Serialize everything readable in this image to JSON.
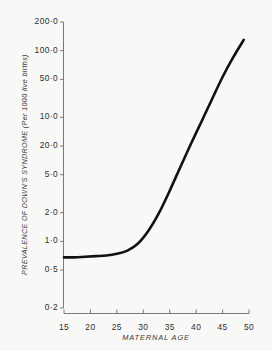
{
  "chart_data": {
    "type": "line",
    "title": "",
    "subtitle": "",
    "xlabel": "MATERNAL  AGE",
    "ylabel": "PREVALENCE OF DOWN'S SYNDROME (Per 1000 live births)",
    "yscale": "log",
    "xlim": [
      15,
      50
    ],
    "ylim": [
      0.2,
      200.0
    ],
    "grid": false,
    "legend": null,
    "xticks": [
      "15",
      "20",
      "25",
      "30",
      "35",
      "40",
      "45",
      "50"
    ],
    "xtick_values": [
      15,
      20,
      25,
      30,
      35,
      40,
      45,
      50
    ],
    "yticks": [
      "200.0",
      "100.0",
      "50.0",
      "10.0",
      "20.0",
      "5.0",
      "2.0",
      "1.0",
      "0.5",
      "0.2"
    ],
    "ytick_values": [
      200.0,
      100.0,
      50.0,
      20.0,
      10.0,
      5.0,
      2.0,
      1.0,
      0.5,
      0.2
    ],
    "series": [
      {
        "name": "Prevalence of Down's syndrome",
        "color": "#111111",
        "x": [
          15,
          17,
          19,
          21,
          23,
          25,
          27,
          29,
          31,
          33,
          35,
          37,
          39,
          41,
          43,
          45,
          47,
          49
        ],
        "y": [
          0.68,
          0.68,
          0.69,
          0.7,
          0.71,
          0.74,
          0.8,
          0.95,
          1.3,
          2.0,
          3.4,
          6.0,
          10.5,
          18.0,
          31.0,
          53.0,
          85.0,
          130.0
        ]
      }
    ]
  },
  "axes": {
    "y_axis_label": "PREVALENCE OF DOWN'S SYNDROME (Per 1000 live births)",
    "x_axis_label": "MATERNAL  AGE"
  },
  "colors": {
    "background": "#f8f8f6",
    "curve": "#111111",
    "axis": "#6b6b6b",
    "text": "#2e2e2e"
  }
}
